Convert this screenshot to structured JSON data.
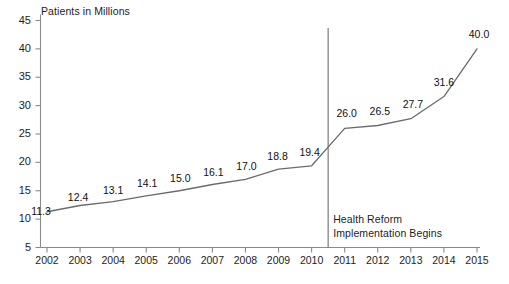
{
  "chart_data": {
    "type": "line",
    "title": "Patients in Millions",
    "xlabel": "",
    "ylabel": "Patients in Millions",
    "categories": [
      "2002",
      "2003",
      "2004",
      "2005",
      "2006",
      "2007",
      "2008",
      "2009",
      "2010",
      "2011",
      "2012",
      "2013",
      "2014",
      "2015"
    ],
    "values": [
      11.3,
      12.4,
      13.1,
      14.1,
      15.0,
      16.1,
      17.0,
      18.8,
      19.4,
      26.0,
      26.5,
      27.7,
      31.6,
      40.0
    ],
    "point_labels": [
      "11.3",
      "12.4",
      "13.1",
      "14.1",
      "15.0",
      "16.1",
      "17.0",
      "18.8",
      "19.4",
      "26.0",
      "26.5",
      "27.7",
      "31.6",
      "40.0"
    ],
    "ylim": [
      5,
      45
    ],
    "ytick_labels": [
      "45",
      "40",
      "35",
      "30",
      "25",
      "20",
      "15",
      "10",
      "5"
    ],
    "ytick_values": [
      45,
      40,
      35,
      30,
      25,
      20,
      15,
      10,
      5
    ],
    "grid": false,
    "legend": null,
    "series": [
      {
        "name": "Patients in Millions",
        "values": [
          11.3,
          12.4,
          13.1,
          14.1,
          15.0,
          16.1,
          17.0,
          18.8,
          19.4,
          26.0,
          26.5,
          27.7,
          31.6,
          40.0
        ]
      }
    ],
    "annotations": [
      {
        "name": "health-reform-marker",
        "type": "vertical-line",
        "x_position": "between 2010 and 2011",
        "line1": "Health Reform",
        "line2": "Implementation Begins"
      }
    ],
    "colors": {
      "line": "#6b6b6b",
      "axis": "#8a8a8a",
      "marker_line": "#7a7a7a",
      "text": "#1d1d1d",
      "background": "#ffffff"
    }
  },
  "footer": {
    "source_note": ""
  }
}
